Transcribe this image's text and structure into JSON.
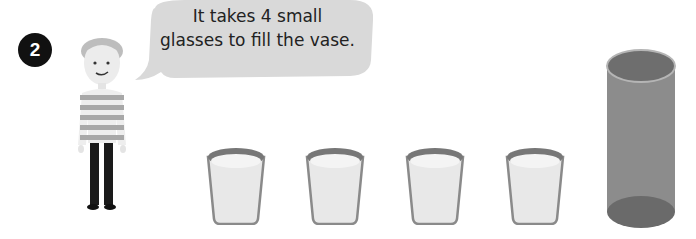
{
  "problem": {
    "number": "2",
    "speech": {
      "line1": "It takes 4 small",
      "line2": "glasses to fill the vase."
    }
  },
  "illustration": {
    "character": "boy-icon",
    "glasses_count": 4,
    "glasses": [
      {
        "name": "small-glass-icon"
      },
      {
        "name": "small-glass-icon"
      },
      {
        "name": "small-glass-icon"
      },
      {
        "name": "small-glass-icon"
      }
    ],
    "container": "vase-icon"
  },
  "colors": {
    "badge": "#111111",
    "bubble": "#d9d9d9",
    "vase": "#8c8c8c",
    "glass_rim": "#7a7a7a",
    "milk": "#e6e6e6"
  }
}
